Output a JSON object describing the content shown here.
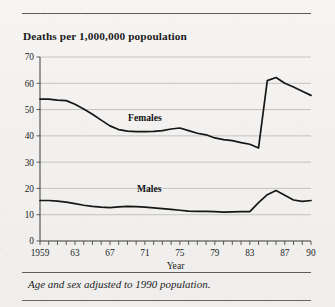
{
  "figure": {
    "title": "Deaths per 1,000,000 popoulation",
    "footnote": "Age and sex adjusted to 1990 population.",
    "line_color": "#161616",
    "grid_color": "#b9b8b5",
    "background": "#f2f1ef"
  },
  "chart_data": {
    "type": "line",
    "title": "Deaths per 1,000,000 popoulation",
    "xlabel": "Year",
    "ylabel": "",
    "xlim": [
      1959,
      1990
    ],
    "ylim": [
      0,
      70
    ],
    "grid": true,
    "legend": "inline-labels",
    "ytick_labels": [
      "0",
      "10",
      "20",
      "30",
      "40",
      "50",
      "60",
      "70"
    ],
    "ytick_values": [
      0,
      10,
      20,
      30,
      40,
      50,
      60,
      70
    ],
    "xtick_labels": [
      "1959",
      "63",
      "67",
      "71",
      "75",
      "79",
      "83",
      "87",
      "90"
    ],
    "xtick_values": [
      1959,
      1963,
      1967,
      1971,
      1975,
      1979,
      1983,
      1987,
      1990
    ],
    "minor_xticks_every": 1,
    "x": [
      1959,
      1960,
      1961,
      1962,
      1963,
      1964,
      1965,
      1966,
      1967,
      1968,
      1969,
      1970,
      1971,
      1972,
      1973,
      1974,
      1975,
      1976,
      1977,
      1978,
      1979,
      1980,
      1981,
      1982,
      1983,
      1984,
      1985,
      1986,
      1987,
      1988,
      1989,
      1990
    ],
    "series": [
      {
        "name": "Females",
        "label": "Females",
        "label_x": 1971.0,
        "label_y": 45.5,
        "values": [
          54.0,
          54.0,
          53.6,
          53.4,
          52.0,
          50.2,
          48.2,
          46.0,
          43.8,
          42.4,
          41.8,
          41.6,
          41.6,
          41.7,
          42.0,
          42.6,
          43.0,
          42.0,
          41.0,
          40.4,
          39.2,
          38.6,
          38.2,
          37.4,
          36.8,
          35.4,
          61.0,
          62.2,
          60.0,
          58.6,
          57.0,
          55.4
        ]
      },
      {
        "name": "Males",
        "label": "Males",
        "label_x": 1971.5,
        "label_y": 18.8,
        "values": [
          15.4,
          15.4,
          15.2,
          14.8,
          14.2,
          13.6,
          13.2,
          12.9,
          12.7,
          13.0,
          13.2,
          13.1,
          12.9,
          12.6,
          12.3,
          12.0,
          11.7,
          11.4,
          11.3,
          11.3,
          11.2,
          11.0,
          11.1,
          11.2,
          11.2,
          14.6,
          17.6,
          19.2,
          17.4,
          15.6,
          15.1,
          15.4
        ]
      }
    ]
  }
}
